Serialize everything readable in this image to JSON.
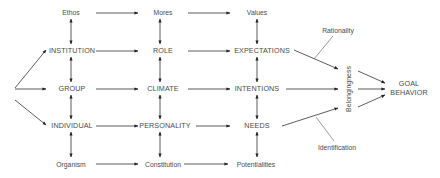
{
  "diagram": {
    "rows": {
      "top": [
        "Ethos",
        "Mores",
        "Values"
      ],
      "institution": [
        "INSTITUTION",
        "ROLE",
        "EXPECTATIONS"
      ],
      "group": [
        "GROUP",
        "CLIMATE",
        "INTENTIONS"
      ],
      "individual": [
        "INDIVIDUAL",
        "PERSONALITY",
        "NEEDS"
      ],
      "bottom": [
        "Organism",
        "Constitution",
        "Potentialities"
      ]
    },
    "belongingness": "Belongingness",
    "rationality": "Rationality",
    "identification": "Identification",
    "goal": [
      "GOAL",
      "BEHAVIOR"
    ],
    "colors": {
      "text": "#4a4a4a",
      "lines": "#333333",
      "background": "#ffffff"
    }
  }
}
